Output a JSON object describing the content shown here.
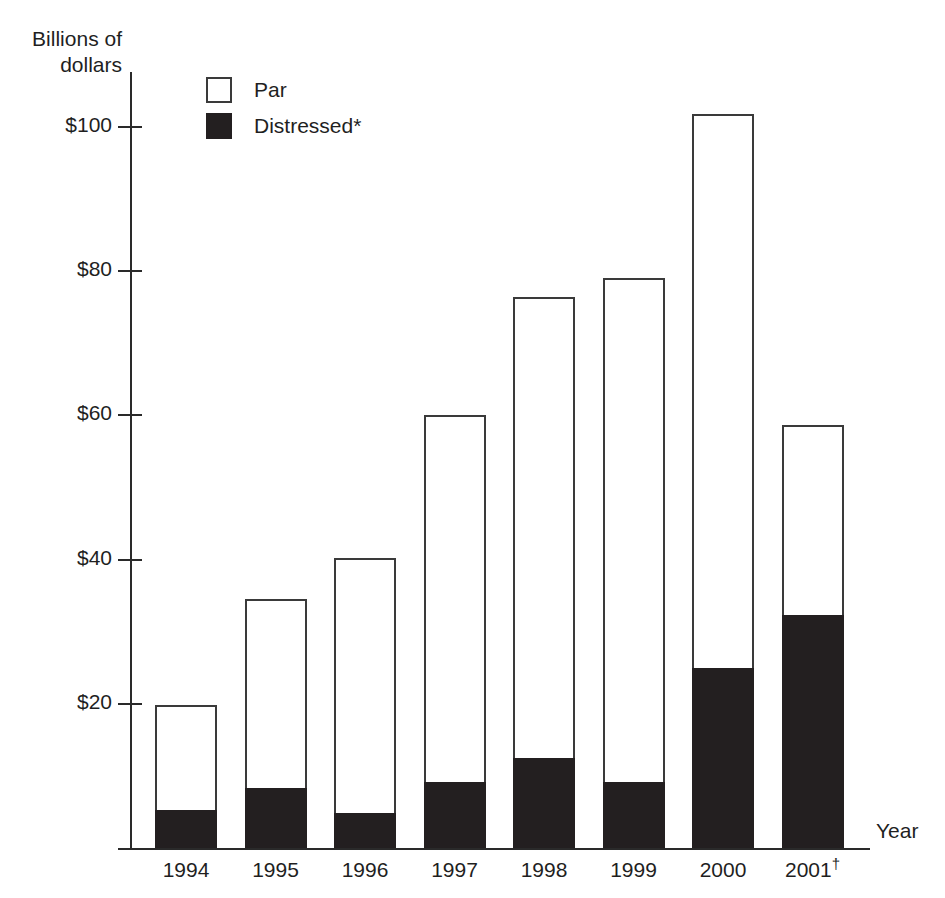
{
  "chart_data": {
    "type": "bar",
    "subtype": "stacked-bar",
    "title": "",
    "xlabel": "Year",
    "ylabel": "Billions of\ndollars",
    "ylabel_line1": "Billions of",
    "ylabel_line2": "dollars",
    "categories": [
      "1994",
      "1995",
      "1996",
      "1997",
      "1998",
      "1999",
      "2000",
      "2001"
    ],
    "category_labels": [
      "1994",
      "1995",
      "1996",
      "1997",
      "1998",
      "1999",
      "2000",
      "2001†"
    ],
    "category_label_marks": [
      "",
      "",
      "",
      "",
      "",
      "",
      "",
      "†"
    ],
    "series": [
      {
        "name": "Distressed*",
        "color": "#231f20",
        "style": "filled",
        "values": [
          5.3,
          8.3,
          4.9,
          9.2,
          12.5,
          9.2,
          25.0,
          32.3
        ]
      },
      {
        "name": "Par",
        "color": "#ffffff",
        "style": "open",
        "values": [
          14.5,
          26.2,
          35.3,
          50.9,
          63.9,
          69.9,
          76.8,
          26.4
        ]
      }
    ],
    "totals": [
      19.8,
      34.5,
      40.2,
      60.1,
      76.4,
      79.1,
      101.8,
      58.7
    ],
    "ylim": [
      0,
      107
    ],
    "yticks": [
      20,
      40,
      60,
      80,
      100
    ],
    "ytick_labels": [
      "$20",
      "$40",
      "$60",
      "$80",
      "$100"
    ],
    "grid": false,
    "legend_position": "top-left-inside",
    "legend": [
      {
        "label": "Par",
        "style": "open"
      },
      {
        "label": "Distressed*",
        "style": "filled"
      }
    ]
  },
  "colors": {
    "distressed": "#231f20",
    "par": "#ffffff",
    "axis": "#2a2a2a",
    "text": "#1f1f1f",
    "background": "#ffffff"
  }
}
